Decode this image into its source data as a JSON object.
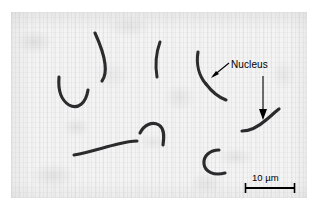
{
  "figure": {
    "kind": "light-micrograph",
    "background_color": "#f4f4f4",
    "cell_color": "#2b2b2e",
    "annotation_color": "#000000"
  },
  "annotations": {
    "nucleus_label": "Nucleus",
    "arrows": [
      {
        "name": "nucleus-arrow-diagonal",
        "direction": "down-left"
      },
      {
        "name": "nucleus-arrow-vertical",
        "direction": "down"
      }
    ]
  },
  "scale_bar": {
    "value": "10",
    "unit": "µm",
    "text": "10 µm",
    "length_px": 50
  },
  "cells": [
    {
      "name": "cell-crescent-upper-left",
      "shape": "crescent"
    },
    {
      "name": "cell-u-shape-left",
      "shape": "u-curve"
    },
    {
      "name": "cell-comma-upper-mid",
      "shape": "comma"
    },
    {
      "name": "cell-arc-center",
      "shape": "arc"
    },
    {
      "name": "cell-s-curve-right",
      "shape": "s-curve"
    },
    {
      "name": "cell-rod-lower-left",
      "shape": "slightly-curved-rod"
    },
    {
      "name": "cell-hook-lower-mid",
      "shape": "hook"
    },
    {
      "name": "cell-c-shape-lower",
      "shape": "c-curve"
    },
    {
      "name": "cell-rod-lower-right",
      "shape": "bent-rod"
    }
  ]
}
